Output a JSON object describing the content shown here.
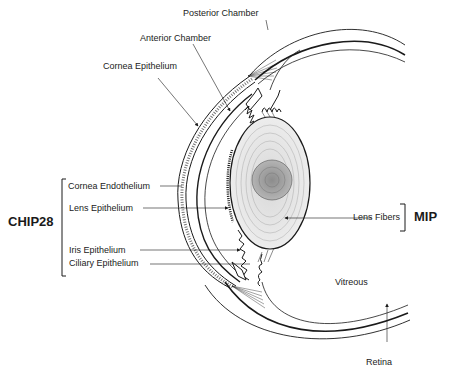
{
  "diagram": {
    "type": "anatomical-cross-section",
    "labels": {
      "posterior_chamber": "Posterior Chamber",
      "anterior_chamber": "Anterior Chamber",
      "cornea_epithelium": "Cornea Epithelium",
      "cornea_endothelium": "Cornea Endothelium",
      "lens_epithelium": "Lens Epithelium",
      "iris_epithelium": "Iris Epithelium",
      "ciliary_epithelium": "Ciliary Epithelium",
      "lens_fibers": "Lens Fibers",
      "vitreous": "Vitreous",
      "retina": "Retina"
    },
    "groups": {
      "chip28": {
        "label": "CHIP28",
        "members": [
          "Cornea Endothelium",
          "Lens Epithelium",
          "Iris Epithelium",
          "Ciliary Epithelium"
        ]
      },
      "mip": {
        "label": "MIP",
        "members": [
          "Lens Fibers"
        ]
      }
    },
    "colors": {
      "line": "#1a1a1a",
      "lens_fill": "#e6e6e6",
      "nucleus_fill": "#a8a8a8",
      "background": "#ffffff"
    }
  }
}
